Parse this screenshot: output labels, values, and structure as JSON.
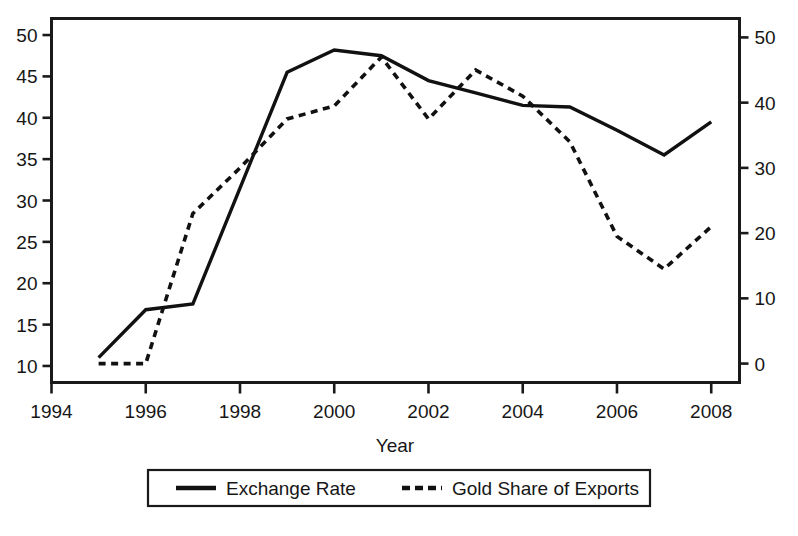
{
  "chart_data": {
    "type": "line",
    "title": "",
    "xlabel": "Year",
    "ylabel": "",
    "grid": false,
    "legend_position": "bottom-center",
    "x": [
      1995,
      1996,
      1997,
      1998,
      1999,
      2000,
      2001,
      2002,
      2003,
      2004,
      2005,
      2006,
      2007,
      2008
    ],
    "xlim": [
      1994,
      2008.6
    ],
    "x_ticks": [
      1994,
      1996,
      1998,
      2000,
      2002,
      2004,
      2006,
      2008
    ],
    "x_tick_labels": [
      "1994",
      "1996",
      "1998",
      "2000",
      "2002",
      "2004",
      "2006",
      "2008"
    ],
    "left_axis": {
      "ylim": [
        8.0,
        52.0
      ],
      "ticks": [
        10,
        15,
        20,
        25,
        30,
        35,
        40,
        45,
        50
      ],
      "tick_labels": [
        "10",
        "15",
        "20",
        "25",
        "30",
        "35",
        "40",
        "45",
        "50"
      ]
    },
    "right_axis": {
      "ylim": [
        -2.9,
        52.9
      ],
      "ticks": [
        0,
        10,
        20,
        30,
        40,
        50
      ],
      "tick_labels": [
        "0",
        "10",
        "20",
        "30",
        "40",
        "50"
      ]
    },
    "series": [
      {
        "name": "Exchange Rate",
        "axis": "left",
        "style": "solid",
        "color": "#111111",
        "values": [
          11.0,
          16.8,
          17.5,
          31.5,
          45.5,
          48.2,
          47.5,
          44.5,
          43.0,
          41.5,
          41.3,
          38.5,
          35.5,
          39.5
        ]
      },
      {
        "name": "Gold Share of Exports",
        "axis": "right",
        "style": "dashed",
        "color": "#111111",
        "values": [
          0.0,
          0.0,
          23.0,
          30.0,
          37.5,
          39.5,
          47.0,
          37.5,
          45.0,
          41.0,
          34.0,
          19.5,
          14.5,
          21.0
        ]
      }
    ]
  },
  "legend": {
    "items": [
      {
        "label": "Exchange Rate",
        "style": "solid"
      },
      {
        "label": "Gold Share of Exports",
        "style": "dashed"
      }
    ]
  },
  "caption": {
    "text": ""
  }
}
